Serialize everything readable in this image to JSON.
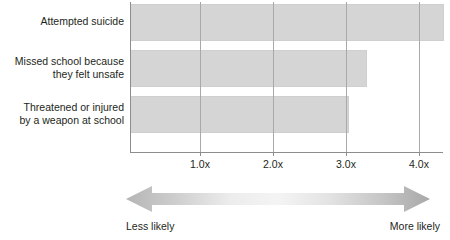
{
  "chart_data": {
    "type": "bar",
    "orientation": "horizontal",
    "title": "",
    "subtitle": "",
    "xlabel": "",
    "ylabel": "",
    "categories": [
      "Attempted suicide",
      "Missed school because\nthey felt unsafe",
      "Threatened or injured\nby a weapon at school"
    ],
    "values": [
      4.3,
      3.25,
      3.0
    ],
    "value_suffix": "x",
    "xlim": [
      0,
      4.28
    ],
    "xticks": [
      1.0,
      2.0,
      3.0,
      4.0
    ],
    "xticklabels": [
      "1.0x",
      "2.0x",
      "3.0x",
      "4.0x"
    ],
    "grid": true,
    "grid_axis": "x",
    "legend": false,
    "bar_color": "#d5d5d5",
    "bar_edge_color": "#cfcfcf",
    "axis_color": "#8d8d8d",
    "grid_color": "#a9a9a9",
    "text_color": "#231f20",
    "annotations": [
      {
        "name": "likelihood-scale-arrow",
        "type": "double-headed-arrow",
        "left_label": "Less likely",
        "right_label": "More likely"
      }
    ]
  },
  "axis": {
    "ticks": [
      {
        "label": "1.0x",
        "value": 1.0
      },
      {
        "label": "2.0x",
        "value": 2.0
      },
      {
        "label": "3.0x",
        "value": 3.0
      },
      {
        "label": "4.0x",
        "value": 4.0
      }
    ]
  },
  "bars": [
    {
      "label": "Attempted suicide",
      "value": 4.3
    },
    {
      "label": "Missed school because\nthey felt unsafe",
      "value": 3.25
    },
    {
      "label": "Threatened or injured\nby a weapon at school",
      "value": 3.0
    }
  ],
  "annotation": {
    "left_label": "Less likely",
    "right_label": "More likely"
  }
}
